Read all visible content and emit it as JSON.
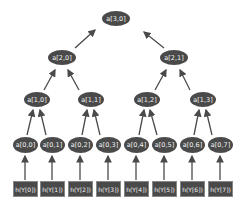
{
  "diagram": {
    "type": "binary-tree",
    "edge_direction": "bottom-up",
    "colors": {
      "node_fill": "#4a4a4a",
      "node_text": "#f2f2f2",
      "arrow": "#4a4a4a",
      "background": "#ffffff"
    },
    "levels": {
      "level3": [
        {
          "label": "a[3,0]"
        }
      ],
      "level2": [
        {
          "label": "a[2,0]"
        },
        {
          "label": "a[2,1]"
        }
      ],
      "level1": [
        {
          "label": "a[1,0]"
        },
        {
          "label": "a[1,1]"
        },
        {
          "label": "a[1,2]"
        },
        {
          "label": "a[1,3]"
        }
      ],
      "level0": [
        {
          "label": "a[0,0]"
        },
        {
          "label": "a[0,1]"
        },
        {
          "label": "a[0,2]"
        },
        {
          "label": "a[0,3]"
        },
        {
          "label": "a[0,4]"
        },
        {
          "label": "a[0,5]"
        },
        {
          "label": "a[0,6]"
        },
        {
          "label": "a[0,7]"
        }
      ],
      "leaves": [
        {
          "label": "h(Y[0])"
        },
        {
          "label": "h(Y[1])"
        },
        {
          "label": "h(Y[2])"
        },
        {
          "label": "h(Y[3])"
        },
        {
          "label": "h(Y[4])"
        },
        {
          "label": "h(Y[5])"
        },
        {
          "label": "h(Y[6])"
        },
        {
          "label": "h(Y[7])"
        }
      ]
    }
  }
}
